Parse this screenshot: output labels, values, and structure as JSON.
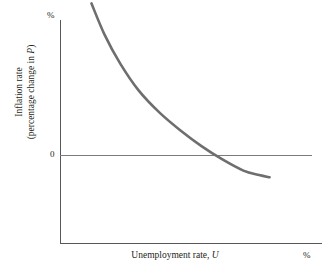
{
  "chart_data": {
    "type": "line",
    "title": "",
    "subtitle": "",
    "xlabel": "Unemployment rate, U",
    "xlabel_plain": "Unemployment rate,",
    "xlabel_italic": "U",
    "ylabel_line1": "Inflation rate",
    "ylabel_line2_pre": "(percentage change in ",
    "ylabel_line2_italic": "P",
    "ylabel_line2_post": ")",
    "ylabel": "Inflation rate (percentage change in P)",
    "x_unit": "%",
    "y_unit": "%",
    "y_tick_labels": [
      "0"
    ],
    "x_tick_labels": [],
    "grid": false,
    "legend": null,
    "annotations": [],
    "xlim": [
      0,
      10
    ],
    "ylim": [
      -2,
      8
    ],
    "series": [
      {
        "name": "Phillips curve",
        "color": "#6e6e70",
        "line_width": 2.6,
        "x": [
          1.2,
          1.7,
          2.3,
          3.0,
          3.8,
          4.6,
          5.4,
          6.2,
          7.0,
          7.6,
          8.0
        ],
        "y": [
          6.8,
          5.4,
          4.1,
          2.9,
          1.9,
          1.1,
          0.4,
          -0.2,
          -0.7,
          -0.9,
          -1.0
        ]
      }
    ],
    "zero_line": {
      "value": 0,
      "color": "#7b7b7d",
      "visible": true
    },
    "axis_color": "#58585a"
  },
  "figure": {
    "background_color": "#ffffff",
    "text_color": "#231f20"
  }
}
